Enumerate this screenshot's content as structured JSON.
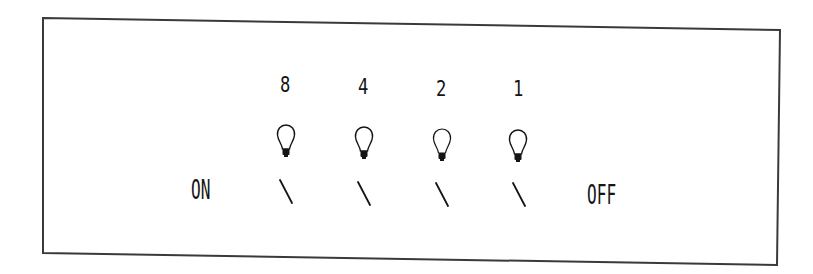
{
  "diagram": {
    "type": "binary-light-panel",
    "frame": {
      "corners": {
        "top_left": [
          43,
          18
        ],
        "top_right": [
          780,
          30
        ],
        "bottom_right": [
          777,
          265
        ],
        "bottom_left": [
          43,
          253
        ]
      },
      "stroke_color": "#3a3a3a"
    },
    "left_label": "ON",
    "right_label": "OFF",
    "columns": [
      {
        "value": "8",
        "bulb_icon": "lightbulb-icon",
        "switch_icon": "switch-lever-icon",
        "switch_state": "tilted"
      },
      {
        "value": "4",
        "bulb_icon": "lightbulb-icon",
        "switch_icon": "switch-lever-icon",
        "switch_state": "tilted"
      },
      {
        "value": "2",
        "bulb_icon": "lightbulb-icon",
        "switch_icon": "switch-lever-icon",
        "switch_state": "tilted"
      },
      {
        "value": "1",
        "bulb_icon": "lightbulb-icon",
        "switch_icon": "switch-lever-icon",
        "switch_state": "tilted"
      }
    ],
    "ink_color": "#151515"
  }
}
